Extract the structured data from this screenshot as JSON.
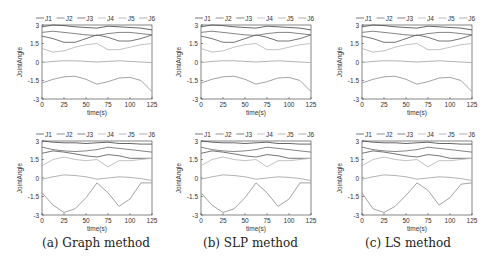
{
  "captions": [
    "(a) Graph method",
    "(b) SLP method",
    "(c) LS method"
  ],
  "legend": [
    "J1",
    "J2",
    "J3",
    "J4",
    "J5",
    "J6"
  ],
  "xlabel": "time(s)",
  "ylabel": "JointAngle",
  "xticks": [
    0,
    25,
    50,
    75,
    100,
    125
  ],
  "yticks": [
    3,
    1.5,
    0,
    -1.5,
    -3
  ],
  "chart_data": [
    {
      "type": "line",
      "title": "(a) Graph method - trajectory 1",
      "xlabel": "time(s)",
      "ylabel": "JointAngle",
      "xlim": [
        0,
        125
      ],
      "ylim": [
        -3,
        3
      ],
      "x": [
        0,
        12.5,
        25,
        37.5,
        50,
        62.5,
        75,
        87.5,
        100,
        112.5,
        125
      ],
      "series": [
        {
          "name": "J1",
          "values": [
            2.85,
            3.0,
            2.95,
            2.85,
            2.8,
            2.75,
            2.9,
            2.85,
            2.8,
            2.75,
            2.6
          ]
        },
        {
          "name": "J2",
          "values": [
            2.4,
            2.5,
            2.4,
            2.3,
            2.2,
            2.15,
            2.3,
            2.4,
            2.4,
            2.3,
            2.2
          ]
        },
        {
          "name": "J3",
          "values": [
            2.1,
            1.9,
            1.6,
            1.6,
            1.9,
            2.2,
            2.0,
            1.7,
            1.7,
            1.9,
            2.2
          ]
        },
        {
          "name": "J4",
          "values": [
            1.1,
            0.8,
            0.9,
            1.2,
            1.4,
            1.5,
            1.0,
            1.0,
            1.2,
            1.4,
            1.5
          ]
        },
        {
          "name": "J5",
          "values": [
            -0.05,
            0.05,
            0.1,
            0.1,
            0.05,
            0.0,
            0.05,
            0.1,
            0.05,
            0.0,
            -0.05
          ]
        },
        {
          "name": "J6",
          "values": [
            -1.7,
            -1.4,
            -1.2,
            -1.15,
            -1.4,
            -1.8,
            -1.6,
            -1.3,
            -1.25,
            -1.5,
            -2.4
          ]
        }
      ]
    },
    {
      "type": "line",
      "title": "(a) Graph method - trajectory 2",
      "xlabel": "time(s)",
      "ylabel": "JointAngle",
      "xlim": [
        0,
        125
      ],
      "ylim": [
        -3,
        3
      ],
      "x": [
        0,
        12.5,
        25,
        37.5,
        50,
        62.5,
        75,
        87.5,
        100,
        112.5,
        125
      ],
      "series": [
        {
          "name": "J1",
          "values": [
            3.0,
            2.9,
            2.85,
            2.85,
            2.8,
            2.85,
            2.9,
            2.8,
            2.8,
            2.75,
            2.75
          ]
        },
        {
          "name": "J2",
          "values": [
            2.5,
            2.3,
            2.2,
            2.15,
            2.2,
            2.3,
            2.5,
            2.4,
            2.3,
            2.2,
            2.1
          ]
        },
        {
          "name": "J3",
          "values": [
            2.0,
            2.2,
            2.1,
            1.95,
            1.8,
            1.7,
            1.9,
            1.8,
            1.6,
            1.6,
            1.6
          ]
        },
        {
          "name": "J4",
          "values": [
            1.0,
            1.5,
            1.7,
            1.5,
            1.4,
            1.5,
            0.9,
            1.4,
            1.4,
            1.5,
            1.6
          ]
        },
        {
          "name": "J5",
          "values": [
            -0.1,
            0.1,
            0.25,
            0.2,
            0.1,
            -0.1,
            0.0,
            0.1,
            0.05,
            -0.05,
            -0.2
          ]
        },
        {
          "name": "J6",
          "values": [
            -1.2,
            -2.2,
            -2.8,
            -2.5,
            -1.6,
            -0.4,
            -1.2,
            -2.3,
            -1.7,
            -0.4,
            -0.4
          ]
        }
      ]
    },
    {
      "type": "line",
      "title": "(b) SLP method - trajectory 1",
      "xlabel": "time(s)",
      "ylabel": "JointAngle",
      "xlim": [
        0,
        125
      ],
      "ylim": [
        -3,
        3
      ],
      "x": [
        0,
        12.5,
        25,
        37.5,
        50,
        62.5,
        75,
        87.5,
        100,
        112.5,
        125
      ],
      "series": [
        {
          "name": "J1",
          "values": [
            2.85,
            3.0,
            2.95,
            2.85,
            2.8,
            2.75,
            2.9,
            2.85,
            2.8,
            2.75,
            2.6
          ]
        },
        {
          "name": "J2",
          "values": [
            2.4,
            2.5,
            2.4,
            2.3,
            2.2,
            2.15,
            2.3,
            2.4,
            2.4,
            2.3,
            2.2
          ]
        },
        {
          "name": "J3",
          "values": [
            2.1,
            1.9,
            1.6,
            1.6,
            1.9,
            2.2,
            2.0,
            1.7,
            1.7,
            1.9,
            2.2
          ]
        },
        {
          "name": "J4",
          "values": [
            1.1,
            0.8,
            0.9,
            1.2,
            1.4,
            1.5,
            1.0,
            1.0,
            1.2,
            1.4,
            1.5
          ]
        },
        {
          "name": "J5",
          "values": [
            -0.05,
            0.05,
            0.1,
            0.1,
            0.05,
            0.0,
            0.05,
            0.1,
            0.05,
            0.0,
            -0.05
          ]
        },
        {
          "name": "J6",
          "values": [
            -1.7,
            -1.4,
            -1.2,
            -1.15,
            -1.4,
            -1.8,
            -1.6,
            -1.3,
            -1.25,
            -1.5,
            -2.4
          ]
        }
      ]
    },
    {
      "type": "line",
      "title": "(b) SLP method - trajectory 2",
      "xlabel": "time(s)",
      "ylabel": "JointAngle",
      "xlim": [
        0,
        125
      ],
      "ylim": [
        -3,
        3
      ],
      "x": [
        0,
        12.5,
        25,
        37.5,
        50,
        62.5,
        75,
        87.5,
        100,
        112.5,
        125
      ],
      "series": [
        {
          "name": "J1",
          "values": [
            3.0,
            2.9,
            2.85,
            2.85,
            2.8,
            2.85,
            2.9,
            2.8,
            2.8,
            2.75,
            2.75
          ]
        },
        {
          "name": "J2",
          "values": [
            2.5,
            2.3,
            2.2,
            2.15,
            2.2,
            2.3,
            2.5,
            2.4,
            2.3,
            2.2,
            2.1
          ]
        },
        {
          "name": "J3",
          "values": [
            2.0,
            2.2,
            2.1,
            1.95,
            1.8,
            1.7,
            1.9,
            1.8,
            1.6,
            1.6,
            1.6
          ]
        },
        {
          "name": "J4",
          "values": [
            1.0,
            1.5,
            1.7,
            1.5,
            1.4,
            1.5,
            0.9,
            1.4,
            1.4,
            1.5,
            1.6
          ]
        },
        {
          "name": "J5",
          "values": [
            -0.1,
            0.1,
            0.25,
            0.2,
            0.1,
            -0.1,
            0.0,
            0.1,
            0.05,
            -0.05,
            -0.2
          ]
        },
        {
          "name": "J6",
          "values": [
            -1.2,
            -2.2,
            -2.8,
            -2.5,
            -1.6,
            -0.4,
            -1.2,
            -2.3,
            -1.7,
            -0.4,
            -0.4
          ]
        }
      ]
    },
    {
      "type": "line",
      "title": "(c) LS method - trajectory 1",
      "xlabel": "time(s)",
      "ylabel": "JointAngle",
      "xlim": [
        0,
        125
      ],
      "ylim": [
        -3,
        3
      ],
      "x": [
        0,
        12.5,
        25,
        37.5,
        50,
        62.5,
        75,
        87.5,
        100,
        112.5,
        125
      ],
      "series": [
        {
          "name": "J1",
          "values": [
            2.85,
            3.0,
            2.95,
            2.85,
            2.8,
            2.75,
            2.9,
            2.85,
            2.8,
            2.75,
            2.6
          ]
        },
        {
          "name": "J2",
          "values": [
            2.4,
            2.5,
            2.4,
            2.3,
            2.2,
            2.15,
            2.3,
            2.4,
            2.4,
            2.3,
            2.2
          ]
        },
        {
          "name": "J3",
          "values": [
            2.1,
            1.9,
            1.6,
            1.6,
            1.9,
            2.2,
            2.0,
            1.7,
            1.7,
            1.9,
            2.2
          ]
        },
        {
          "name": "J4",
          "values": [
            1.1,
            0.8,
            0.9,
            1.2,
            1.4,
            1.5,
            1.0,
            1.0,
            1.2,
            1.4,
            1.5
          ]
        },
        {
          "name": "J5",
          "values": [
            -0.05,
            0.05,
            0.1,
            0.1,
            0.05,
            0.0,
            0.05,
            0.1,
            0.05,
            0.0,
            -0.05
          ]
        },
        {
          "name": "J6",
          "values": [
            -1.7,
            -1.4,
            -1.2,
            -1.15,
            -1.4,
            -1.8,
            -1.6,
            -1.3,
            -1.25,
            -1.5,
            -2.4
          ]
        }
      ]
    },
    {
      "type": "line",
      "title": "(c) LS method - trajectory 2",
      "xlabel": "time(s)",
      "ylabel": "JointAngle",
      "xlim": [
        0,
        125
      ],
      "ylim": [
        -3,
        3
      ],
      "x": [
        0,
        12.5,
        25,
        37.5,
        50,
        62.5,
        75,
        87.5,
        100,
        112.5,
        125
      ],
      "series": [
        {
          "name": "J1",
          "values": [
            3.0,
            2.9,
            2.85,
            2.85,
            2.8,
            2.85,
            2.9,
            2.8,
            2.8,
            2.75,
            2.75
          ]
        },
        {
          "name": "J2",
          "values": [
            2.5,
            2.3,
            2.2,
            2.15,
            2.2,
            2.3,
            2.5,
            2.4,
            2.3,
            2.2,
            2.1
          ]
        },
        {
          "name": "J3",
          "values": [
            2.0,
            2.2,
            2.1,
            1.95,
            1.8,
            1.7,
            1.9,
            1.8,
            1.6,
            1.6,
            1.6
          ]
        },
        {
          "name": "J4",
          "values": [
            1.0,
            1.5,
            1.7,
            1.5,
            1.4,
            1.5,
            0.9,
            1.4,
            1.4,
            1.5,
            1.6
          ]
        },
        {
          "name": "J5",
          "values": [
            -0.1,
            0.1,
            0.25,
            0.2,
            0.1,
            -0.1,
            0.0,
            0.1,
            0.05,
            -0.05,
            -0.2
          ]
        },
        {
          "name": "J6",
          "values": [
            -1.2,
            -2.5,
            -2.8,
            -2.3,
            -1.4,
            -0.4,
            -1.0,
            -2.2,
            -1.6,
            -0.5,
            -0.4
          ]
        }
      ]
    }
  ],
  "series_colors": {
    "J1": "#555555",
    "J2": "#777777",
    "J3": "#666666",
    "J4": "#bbbbbb",
    "J5": "#aaaaaa",
    "J6": "#999999"
  }
}
